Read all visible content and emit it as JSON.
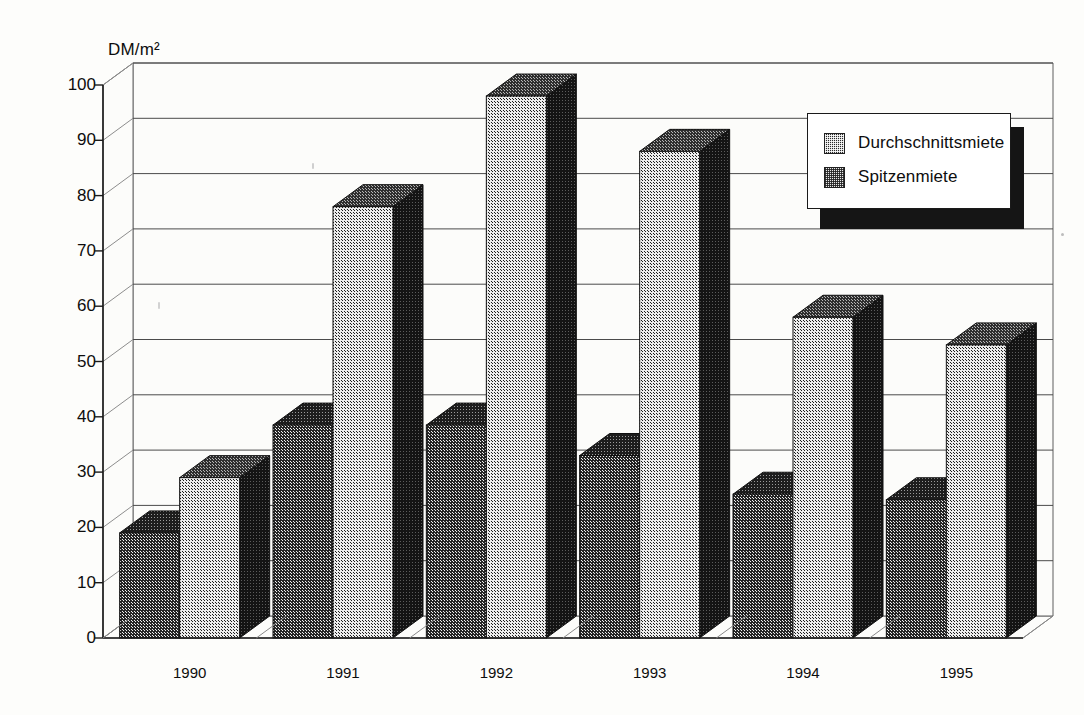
{
  "chart_data": {
    "type": "bar",
    "title": "",
    "subtitle": "",
    "xlabel": "",
    "ylabel": "DM/m²",
    "unit_label": "DM/m²",
    "categories": [
      "1990",
      "1991",
      "1992",
      "1993",
      "1994",
      "1995"
    ],
    "series": [
      {
        "name": "Durchschnittsmiete",
        "color": "#2a2a2a",
        "pattern": "dark-checker",
        "values": [
          19,
          38.5,
          38.5,
          33,
          26,
          25
        ]
      },
      {
        "name": "Spitzenmiete",
        "color": "#e9e9e9",
        "pattern": "light-checker",
        "values": [
          29,
          78,
          98,
          88,
          58,
          53
        ]
      }
    ],
    "ylim": [
      0,
      100
    ],
    "ytick_values": [
      0,
      10,
      20,
      30,
      40,
      50,
      60,
      70,
      80,
      90,
      100
    ],
    "ytick_labels": [
      "0",
      "10",
      "20",
      "30",
      "40",
      "50",
      "60",
      "70",
      "80",
      "90",
      "100"
    ],
    "grid": true,
    "grid_axis": "y",
    "legend_position": "top-right",
    "style": "3d-column",
    "background": "#fdfdfb"
  },
  "legend": {
    "entries": [
      {
        "label": "Durchschnittsmiete",
        "swatch": "sw-dark"
      },
      {
        "label": "Spitzenmiete",
        "swatch": "sw-light"
      }
    ]
  }
}
